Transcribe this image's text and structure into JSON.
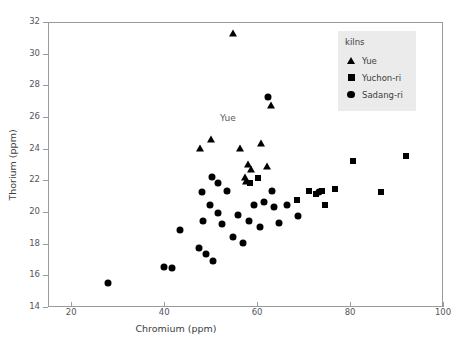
{
  "chart_data": {
    "type": "scatter",
    "title": "",
    "xlabel": "Chromium (ppm)",
    "ylabel": "Thorium (ppm)",
    "xlim": [
      15,
      100
    ],
    "ylim": [
      14,
      32
    ],
    "xticks": [
      20,
      40,
      60,
      80,
      100
    ],
    "yticks": [
      14,
      16,
      18,
      20,
      22,
      24,
      26,
      28,
      30,
      32
    ],
    "grid": false,
    "legend_position": "top-right",
    "legend_title": "kilns",
    "annotations": [
      {
        "text": "Yue",
        "x": 53.5,
        "y": 26.0
      }
    ],
    "series": [
      {
        "name": "Yue",
        "marker": "triangle",
        "color": "#000000",
        "points": [
          [
            54.5,
            31.4
          ],
          [
            62.8,
            26.8
          ],
          [
            47.5,
            24.1
          ],
          [
            49.8,
            24.7
          ],
          [
            56.0,
            24.1
          ],
          [
            60.7,
            24.4
          ],
          [
            57.8,
            23.1
          ],
          [
            62.0,
            23.0
          ],
          [
            57.2,
            22.3
          ],
          [
            57.3,
            22.0
          ],
          [
            58.5,
            22.8
          ]
        ]
      },
      {
        "name": "Yuchon-ri",
        "marker": "square",
        "color": "#000000",
        "points": [
          [
            68.3,
            20.8
          ],
          [
            71.0,
            21.4
          ],
          [
            72.5,
            21.2
          ],
          [
            73.8,
            21.4
          ],
          [
            74.4,
            20.5
          ],
          [
            76.5,
            21.5
          ],
          [
            80.5,
            23.3
          ],
          [
            86.5,
            21.3
          ],
          [
            91.8,
            23.6
          ],
          [
            58.2,
            21.9
          ],
          [
            60.0,
            22.2
          ]
        ]
      },
      {
        "name": "Sadang-ri",
        "marker": "circle",
        "color": "#000000",
        "points": [
          [
            27.8,
            15.6
          ],
          [
            39.8,
            16.6
          ],
          [
            41.5,
            16.5
          ],
          [
            43.2,
            18.9
          ],
          [
            47.2,
            17.8
          ],
          [
            48.0,
            21.3
          ],
          [
            48.2,
            19.5
          ],
          [
            48.8,
            17.4
          ],
          [
            49.6,
            20.5
          ],
          [
            50.0,
            22.3
          ],
          [
            50.2,
            17.0
          ],
          [
            51.4,
            21.9
          ],
          [
            51.3,
            20.0
          ],
          [
            52.2,
            19.3
          ],
          [
            53.3,
            21.4
          ],
          [
            54.5,
            18.5
          ],
          [
            55.6,
            19.9
          ],
          [
            56.8,
            18.1
          ],
          [
            58.0,
            19.5
          ],
          [
            59.2,
            20.5
          ],
          [
            60.3,
            19.1
          ],
          [
            61.2,
            20.7
          ],
          [
            62.2,
            27.3
          ],
          [
            63.0,
            21.4
          ],
          [
            63.4,
            20.4
          ],
          [
            64.5,
            19.4
          ],
          [
            66.2,
            20.5
          ],
          [
            68.5,
            19.8
          ],
          [
            73.0,
            21.3
          ]
        ]
      }
    ]
  }
}
